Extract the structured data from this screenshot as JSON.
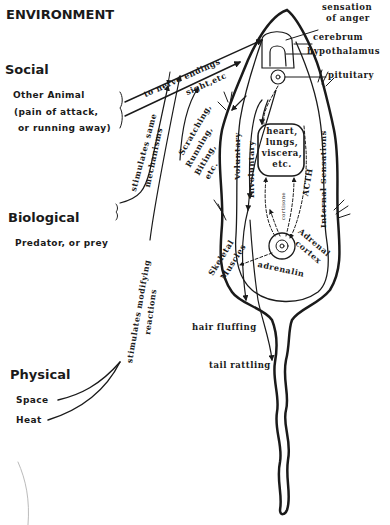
{
  "environment": {
    "title": "ENVIRONMENT",
    "social": {
      "heading": "Social",
      "line1": "Other Animal",
      "line2": "pain of attack,",
      "line3": "or running away"
    },
    "biological": {
      "heading": "Biological",
      "line1": "Predator, or prey"
    },
    "physical": {
      "heading": "Physical",
      "line1": "Space",
      "line2": "Heat"
    }
  },
  "pathways": {
    "to_nerve_endings": "to nerve endings",
    "sight_etc": "sight,etc",
    "stimulates_same": "stimulates same",
    "mechanisms": "mechanisms",
    "stimulates_modifying": "stimulates modifying",
    "reactions": "reactions",
    "scratching": "Scratching,",
    "running": "Running,",
    "biting": "Biting,",
    "etc": "etc."
  },
  "body": {
    "sensation_line1": "sensation",
    "sensation_line2": "of anger",
    "cerebrum": "cerebrum",
    "hypothalamus": "hypothalamus",
    "pituitary": "pituitary",
    "voluntary": "Voluntary",
    "involuntary": "Involuntary",
    "internal_sensations": "Internal Sensations",
    "acth": "ACTH",
    "cortisone": "cortisone",
    "organs": [
      "heart,",
      "lungs,",
      "viscera,",
      "etc."
    ],
    "adrenal_line1": "Adrenal",
    "adrenal_line2": "cortex",
    "adrenalin": "adrenalin",
    "skeletal_line1": "Skeletal",
    "skeletal_line2": "Muscles"
  },
  "responses": {
    "hair_fluffing": "hair fluffing",
    "tail_rattling": "tail rattling"
  },
  "colors": {
    "ink": "#1a1a1a",
    "background": "#ffffff"
  }
}
